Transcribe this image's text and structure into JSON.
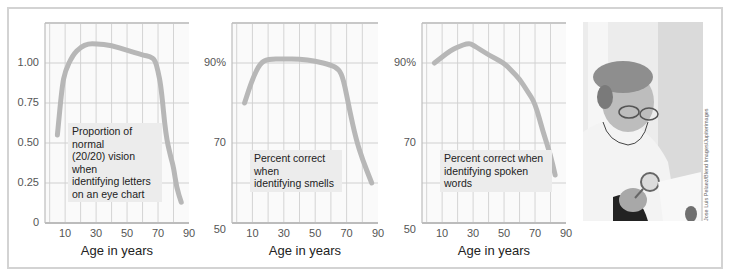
{
  "figure": {
    "photo_alt": "Elderly woman with glasses examining a document with a magnifying glass",
    "photo_credit": "Jose Luis Pelaez/Blend Images/Jupiterimages"
  },
  "chart_data": [
    {
      "type": "line",
      "title": "",
      "annotation": "Proportion of normal (20/20) vision when identifying letters on an eye chart",
      "annotation_lines": [
        "Proportion of normal",
        "(20/20) vision when",
        "identifying letters",
        "on an eye chart"
      ],
      "xlabel": "Age in years",
      "ylabel": "",
      "x_ticks": [
        "10",
        "30",
        "50",
        "70",
        "90"
      ],
      "y_ticks": [
        "0",
        "0.25",
        "0.50",
        "0.75",
        "1.00"
      ],
      "xlim": [
        -3,
        90
      ],
      "ylim": [
        0,
        1.25
      ],
      "grid": true,
      "x": [
        5,
        8,
        10,
        15,
        20,
        25,
        30,
        40,
        50,
        60,
        65,
        68,
        70,
        72,
        75,
        78,
        80,
        82,
        85
      ],
      "values": [
        0.55,
        0.85,
        0.95,
        1.05,
        1.1,
        1.12,
        1.12,
        1.11,
        1.08,
        1.05,
        1.04,
        1.02,
        0.95,
        0.85,
        0.55,
        0.42,
        0.35,
        0.22,
        0.13
      ]
    },
    {
      "type": "line",
      "title": "",
      "annotation": "Percent correct when identifying smells",
      "annotation_lines": [
        "Percent correct when",
        "identifying smells"
      ],
      "xlabel": "Age in years",
      "ylabel": "",
      "x_ticks": [
        "10",
        "30",
        "50",
        "70",
        "90"
      ],
      "y_ticks": [
        "50",
        "70",
        "90%"
      ],
      "xlim": [
        -3,
        90
      ],
      "ylim": [
        50,
        100
      ],
      "grid": true,
      "x": [
        5,
        10,
        15,
        20,
        30,
        40,
        50,
        60,
        65,
        68,
        72,
        76,
        80,
        86
      ],
      "values": [
        80,
        86,
        90,
        91,
        91,
        91,
        90.5,
        89.5,
        88.5,
        86,
        78,
        71,
        66,
        60
      ]
    },
    {
      "type": "line",
      "title": "",
      "annotation": "Percent correct when identifying spoken words",
      "annotation_lines": [
        "Percent correct when",
        "identifying spoken words"
      ],
      "xlabel": "Age in years",
      "ylabel": "",
      "x_ticks": [
        "10",
        "30",
        "50",
        "70",
        "90"
      ],
      "y_ticks": [
        "50",
        "70",
        "90%"
      ],
      "xlim": [
        -3,
        90
      ],
      "ylim": [
        50,
        100
      ],
      "grid": true,
      "x": [
        5,
        10,
        15,
        20,
        27,
        30,
        40,
        50,
        55,
        60,
        65,
        70,
        75,
        80,
        83
      ],
      "values": [
        90,
        91.5,
        93,
        94,
        95,
        94.5,
        92,
        90,
        88,
        86,
        83,
        80,
        73,
        67,
        62
      ]
    }
  ]
}
